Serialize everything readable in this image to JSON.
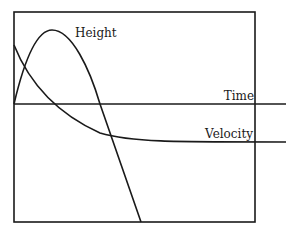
{
  "diagram": {
    "type": "motion-graph",
    "labels": {
      "height": "Height",
      "time": "Time",
      "velocity": "Velocity"
    },
    "colors": {
      "ink": "#1a1a1a",
      "background": "#ffffff"
    },
    "curves": [
      {
        "name": "Height",
        "description": "rises from origin to a peak, then falls below the time axis"
      },
      {
        "name": "Velocity",
        "description": "starts high, decreases and levels off at a negative terminal value"
      },
      {
        "name": "Time",
        "description": "horizontal time axis"
      }
    ]
  }
}
